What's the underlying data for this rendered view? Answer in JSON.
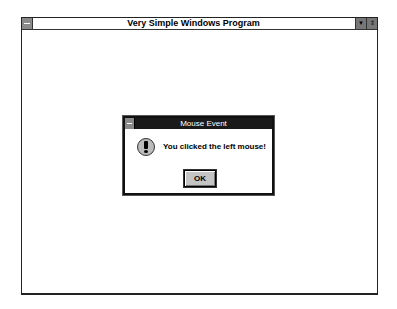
{
  "window": {
    "title": "Very Simple Windows Program",
    "icons": {
      "system_menu": "system-menu-icon",
      "minimize": "minimize-arrow-icon",
      "maximize": "maximize-arrow-icon"
    },
    "minimize_glyph": "▼",
    "maximize_glyph": "⇕"
  },
  "dialog": {
    "title": "Mouse Event",
    "icon": "exclamation-icon",
    "message": "You clicked the left mouse!",
    "ok_label": "OK"
  }
}
